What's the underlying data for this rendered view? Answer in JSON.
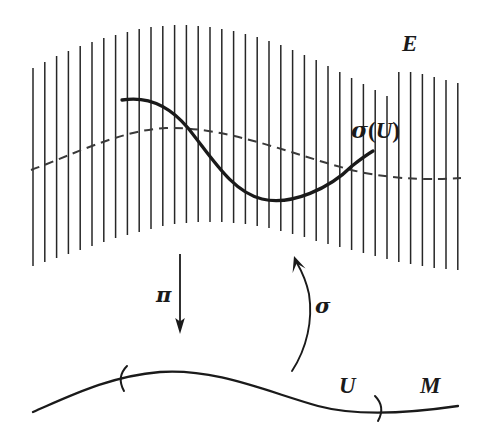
{
  "diagram": {
    "kind": "fiber-bundle-section-diagram",
    "background_color": "#ffffff",
    "ink_color": "#1a1a1a",
    "labels": {
      "total_space": "E",
      "section_image": "σ(U)",
      "section_image_parts": {
        "sigma": "σ",
        "open_paren": "(",
        "u": "U",
        "close_paren": ")"
      },
      "projection": "π",
      "section": "σ",
      "open_set": "U",
      "base_manifold": "M"
    },
    "elements": {
      "fiber_lines": {
        "name": "fiber-lines",
        "count": 37,
        "x_start": 33,
        "x_end": 458,
        "spacing": 11.8,
        "stroke_width": 1.5
      },
      "zero_section": {
        "name": "dashed-reference-curve",
        "style": "dashed",
        "dash_pattern": "9 6"
      },
      "section_curve": {
        "name": "section-curve",
        "style": "solid",
        "stroke_width": 3.2
      },
      "projection_arrow": {
        "name": "projection-arrow",
        "direction": "down",
        "x": 180,
        "y_start": 254,
        "y_end": 330
      },
      "section_arrow": {
        "name": "section-arrow",
        "direction": "up-curved",
        "y_start": 371,
        "y_end": 259
      },
      "base_curve": {
        "name": "base-manifold-curve",
        "stroke_width": 2.2
      },
      "brackets": {
        "left": "(",
        "right": ")"
      }
    }
  }
}
